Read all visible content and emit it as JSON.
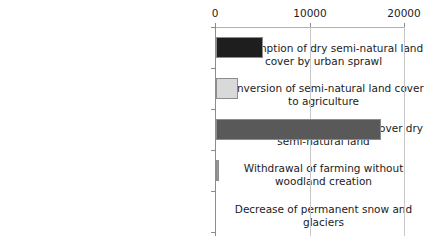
{
  "chart_data": {
    "type": "bar",
    "orientation": "horizontal",
    "title": "",
    "xlabel": "",
    "ylabel": "",
    "xlim": [
      0,
      20000
    ],
    "xticks": [
      "0",
      "10000",
      "20000"
    ],
    "xtick_values": [
      0,
      10000,
      20000
    ],
    "grid": "vertical",
    "axis_position": "top",
    "legend": "none",
    "categories": [
      "Consumption of dry semi-natural land cover by urban sprawl",
      "Conversion of semi-natural land cover to agriculture",
      "Forest creation, afforestation over dry semi-natural land",
      "Withdrawal of farming without woodland creation",
      "Decrease of permanent snow and glaciers"
    ],
    "values": [
      5000,
      2330,
      17500,
      300,
      0
    ],
    "bar_colors": [
      "#1e1e1e",
      "#d9d9d9",
      "#595959",
      "#9a9a9a",
      "#9a9a9a"
    ],
    "bar_edge_color": "#8c8c8c"
  },
  "axis": {
    "tick_0": "0",
    "tick_1": "10000",
    "tick_2": "20000"
  },
  "labels": {
    "cat_0": "Consumption of dry semi-natural land cover by urban sprawl",
    "cat_1": "Conversion of semi-natural land cover to agriculture",
    "cat_2": "Forest creation, afforestation over dry semi-natural land",
    "cat_3": "Withdrawal of farming without woodland creation",
    "cat_4": "Decrease of permanent snow and glaciers"
  }
}
